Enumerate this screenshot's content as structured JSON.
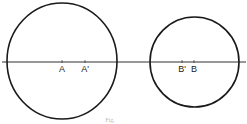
{
  "diagram": {
    "colors": {
      "stroke": "#1a1a1a",
      "background": "#ffffff",
      "text": "#222222"
    },
    "axis": {
      "x1": 2,
      "x2": 246,
      "y": 62
    },
    "circles": [
      {
        "id": "large",
        "cx": 62,
        "cy": 61,
        "rx": 55,
        "ry": 58
      },
      {
        "id": "small",
        "cx": 194.5,
        "cy": 62,
        "rx": 44.5,
        "ry": 45
      }
    ],
    "points": [
      {
        "label": "A",
        "x": 62
      },
      {
        "label": "A'",
        "x": 85
      },
      {
        "label": "B'",
        "x": 182
      },
      {
        "label": "B",
        "x": 194
      }
    ],
    "caption": "Fig."
  }
}
